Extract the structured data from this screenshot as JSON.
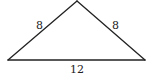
{
  "diagram": {
    "type": "triangle",
    "labels": {
      "left_side": "8",
      "right_side": "8",
      "base": "12"
    },
    "colors": {
      "stroke": "#222222",
      "background": "#ffffff"
    }
  }
}
